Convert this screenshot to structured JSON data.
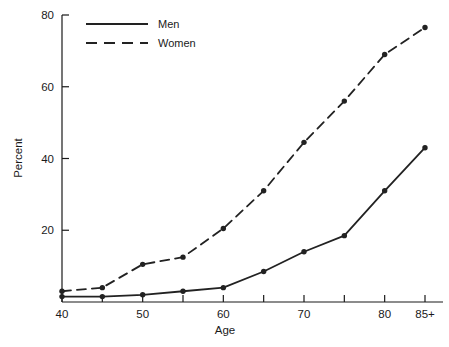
{
  "chart_data": {
    "type": "line",
    "title": "",
    "xlabel": "Age",
    "ylabel": "Percent",
    "x": [
      40,
      45,
      50,
      55,
      60,
      65,
      70,
      75,
      80,
      85
    ],
    "xtick_labels": [
      "40",
      "45",
      "50",
      "55",
      "60",
      "65",
      "70",
      "75",
      "80",
      "85+"
    ],
    "xtick_labels_shown": [
      "40",
      "50",
      "60",
      "70",
      "80",
      "85+"
    ],
    "ytick_labels": [
      "20",
      "40",
      "60",
      "80"
    ],
    "yticks": [
      20,
      40,
      60,
      80
    ],
    "xlim": [
      40,
      85
    ],
    "ylim": [
      0,
      80
    ],
    "grid": false,
    "legend_position": "top-left-inside",
    "markers": "filled-circle",
    "series": [
      {
        "name": "Men",
        "style": "solid",
        "color": "#222222",
        "values": [
          1.5,
          1.5,
          2.0,
          3.0,
          4.0,
          8.5,
          14.0,
          18.5,
          31.0,
          43.0
        ]
      },
      {
        "name": "Women",
        "style": "dashed",
        "color": "#222222",
        "values": [
          3.0,
          4.0,
          10.5,
          12.5,
          20.5,
          31.0,
          44.5,
          56.0,
          69.0,
          76.5
        ]
      }
    ]
  },
  "legend": {
    "entries": [
      {
        "label": "Men",
        "style": "solid"
      },
      {
        "label": "Women",
        "style": "dashed"
      }
    ]
  },
  "axes": {
    "y_axis_label": "Percent",
    "x_axis_label": "Age"
  }
}
